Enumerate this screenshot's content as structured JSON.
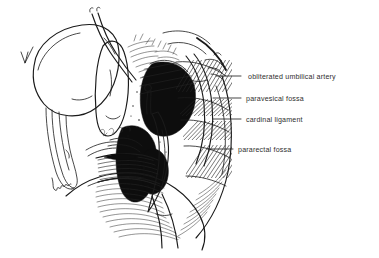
{
  "figure": {
    "style": "pen-and-ink line drawing, black on white",
    "background_color": "#ffffff",
    "ink_color": "#1a1a1a",
    "label_color": "#2e2e2e"
  },
  "labels": [
    {
      "id": "obliterated-umbilical-artery",
      "text": "obliterated umbilical artery",
      "x": 248,
      "y": 79,
      "leader_x1": 241,
      "leader_x2": 216,
      "leader_y": 76
    },
    {
      "id": "paravesical-fossa",
      "text": "paravesical fossa",
      "x": 246,
      "y": 101,
      "leader_x1": 241,
      "leader_x2": 213,
      "leader_y": 98
    },
    {
      "id": "cardinal-ligament",
      "text": "cardinal ligament",
      "x": 246,
      "y": 122,
      "leader_x1": 241,
      "leader_x2": 213,
      "leader_y": 119
    },
    {
      "id": "pararectal-fossa",
      "text": "pararectal fossa",
      "x": 238,
      "y": 152,
      "leader_x1": 233,
      "leader_x2": 207,
      "leader_y": 149
    }
  ],
  "structures": [
    {
      "id": "bladder",
      "name": "urinary bladder",
      "region": "left, large oval outline"
    },
    {
      "id": "uterus",
      "name": "uterus / cervix",
      "region": "center-left, elongated body"
    },
    {
      "id": "ureter",
      "name": "ureter",
      "region": "upper center, thin paired tubes"
    },
    {
      "id": "dark-pelvic-mass",
      "name": "cardinal ligament mass",
      "region": "center, dense black stipple"
    },
    {
      "id": "peritoneal-folds",
      "name": "hatched peritoneal folds",
      "region": "right of center, diagonal hatching"
    },
    {
      "id": "pelvic-floor",
      "name": "pelvic floor / rectum",
      "region": "lower center, fine hatching"
    },
    {
      "id": "vagina",
      "name": "vaginal wall",
      "region": "lower left of center, banded hatching"
    }
  ]
}
